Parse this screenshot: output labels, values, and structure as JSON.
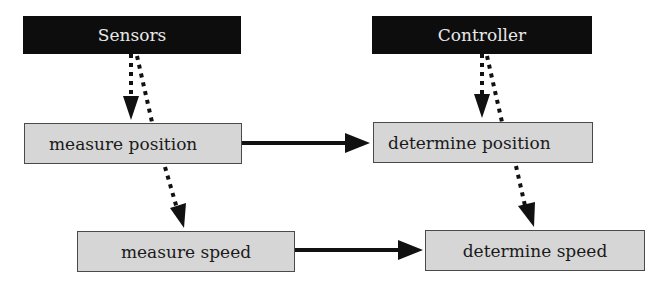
{
  "diagram": {
    "nodes": [
      {
        "id": "sensors",
        "label": "Sensors",
        "style": "dark"
      },
      {
        "id": "controller",
        "label": "Controller",
        "style": "dark"
      },
      {
        "id": "measure_position",
        "label": "measure position",
        "style": "light"
      },
      {
        "id": "determine_position",
        "label": "determine position",
        "style": "light"
      },
      {
        "id": "measure_speed",
        "label": "measure speed",
        "style": "light"
      },
      {
        "id": "determine_speed",
        "label": "determine speed",
        "style": "light"
      }
    ],
    "edges": [
      {
        "from": "sensors",
        "to": "measure_position",
        "type": "dotted-arrow"
      },
      {
        "from": "sensors",
        "to": "measure_position",
        "type": "dotted-line"
      },
      {
        "from": "measure_position",
        "to": "measure_speed",
        "type": "dotted-arrow"
      },
      {
        "from": "controller",
        "to": "determine_position",
        "type": "dotted-arrow"
      },
      {
        "from": "controller",
        "to": "determine_position",
        "type": "dotted-line"
      },
      {
        "from": "determine_position",
        "to": "determine_speed",
        "type": "dotted-arrow"
      },
      {
        "from": "measure_position",
        "to": "determine_position",
        "type": "solid-arrow"
      },
      {
        "from": "measure_speed",
        "to": "determine_speed",
        "type": "solid-arrow"
      }
    ],
    "colors": {
      "dark_box": "#0d0d0d",
      "dark_text": "#e8e8e8",
      "light_box": "#d6d6d6",
      "border": "#4a4a4a"
    }
  }
}
